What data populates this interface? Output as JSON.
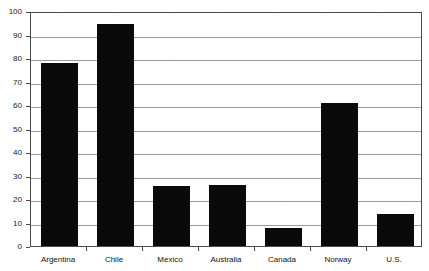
{
  "chart_data": {
    "type": "bar",
    "title": "",
    "xlabel": "",
    "ylabel": "",
    "ylim": [
      0,
      100
    ],
    "ytick_step": 10,
    "yticks": [
      0,
      10,
      20,
      30,
      40,
      50,
      60,
      70,
      80,
      90,
      100
    ],
    "ytick_labels": [
      "0",
      "10",
      "20",
      "30",
      "40",
      "50",
      "60",
      "70",
      "80",
      "90",
      "100"
    ],
    "grid": "horizontal",
    "legend": "none",
    "bar_color": "#0a0a0a",
    "gridline_color": "#9b9b9b",
    "frame_color": "#4a4a4a",
    "background_color": "#ffffff",
    "categories": [
      "Argentina",
      "Chile",
      "Mexico",
      "Australia",
      "Canada",
      "Norway",
      "U.S."
    ],
    "values": [
      78,
      94.5,
      25.5,
      26,
      7.5,
      61,
      13.5
    ],
    "series": [
      {
        "name": "",
        "values": [
          78,
          94.5,
          25.5,
          26,
          7.5,
          61,
          13.5
        ]
      }
    ],
    "points": [
      {
        "category": "Argentina",
        "value": 78
      },
      {
        "category": "Chile",
        "value": 94.5
      },
      {
        "category": "Mexico",
        "value": 25.5
      },
      {
        "category": "Australia",
        "value": 26
      },
      {
        "category": "Canada",
        "value": 7.5
      },
      {
        "category": "Norway",
        "value": 61
      },
      {
        "category": "U.S.",
        "value": 13.5
      }
    ]
  }
}
